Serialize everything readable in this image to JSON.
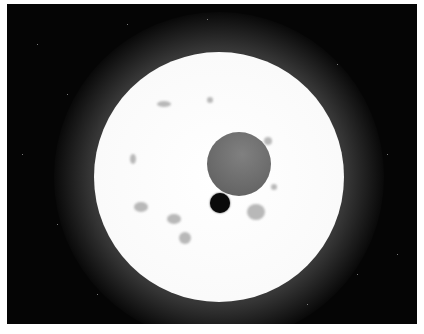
{
  "image": {
    "subject": "Illustration of a bright star with a planet and moon transiting its disk",
    "colors": {
      "background": "#050505",
      "border": "#ffffff",
      "star": "#ffffff",
      "planet": "#6a6a6a",
      "moon": "#0a0a0a"
    }
  }
}
